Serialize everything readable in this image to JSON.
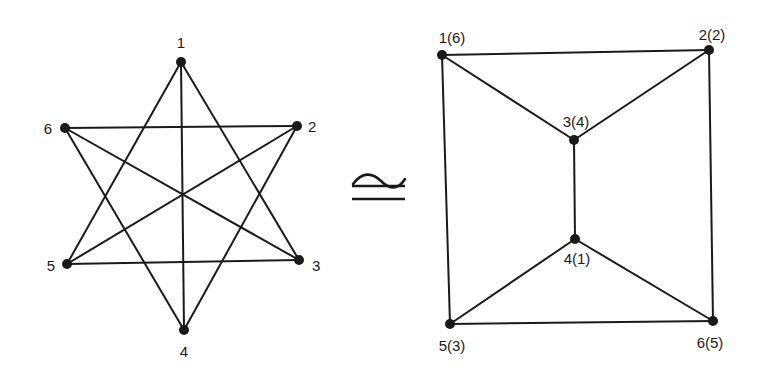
{
  "left_graph": {
    "nodes": [
      {
        "id": "1",
        "label": "1",
        "x": 181,
        "y": 62,
        "lx": 181,
        "ly": 48,
        "anchor": "middle"
      },
      {
        "id": "2",
        "label": "2",
        "x": 297,
        "y": 126,
        "lx": 308,
        "ly": 132,
        "anchor": "start"
      },
      {
        "id": "3",
        "label": "3",
        "x": 299,
        "y": 260,
        "lx": 312,
        "ly": 271,
        "anchor": "start"
      },
      {
        "id": "4",
        "label": "4",
        "x": 184,
        "y": 330,
        "lx": 184,
        "ly": 357,
        "anchor": "middle"
      },
      {
        "id": "5",
        "label": "5",
        "x": 67,
        "y": 264,
        "lx": 55,
        "ly": 271,
        "anchor": "end"
      },
      {
        "id": "6",
        "label": "6",
        "x": 65,
        "y": 128,
        "lx": 52,
        "ly": 134,
        "anchor": "end"
      }
    ],
    "edges": [
      [
        "1",
        "5"
      ],
      [
        "1",
        "4"
      ],
      [
        "1",
        "3"
      ],
      [
        "6",
        "2"
      ],
      [
        "6",
        "3"
      ],
      [
        "6",
        "4"
      ],
      [
        "2",
        "5"
      ],
      [
        "2",
        "4"
      ],
      [
        "5",
        "3"
      ]
    ]
  },
  "relation_symbol": "≅",
  "right_graph": {
    "nodes": [
      {
        "id": "1",
        "label": "1(6)",
        "x": 442,
        "y": 55,
        "lx": 452,
        "ly": 43,
        "anchor": "middle"
      },
      {
        "id": "2",
        "label": "2(2)",
        "x": 709,
        "y": 50,
        "lx": 712,
        "ly": 40,
        "anchor": "middle"
      },
      {
        "id": "3",
        "label": "3(4)",
        "x": 574,
        "y": 140,
        "lx": 576,
        "ly": 127,
        "anchor": "middle"
      },
      {
        "id": "4",
        "label": "4(1)",
        "x": 575,
        "y": 239,
        "lx": 577,
        "ly": 264,
        "anchor": "middle"
      },
      {
        "id": "5",
        "label": "5(3)",
        "x": 450,
        "y": 324,
        "lx": 452,
        "ly": 351,
        "anchor": "middle"
      },
      {
        "id": "6",
        "label": "6(5)",
        "x": 713,
        "y": 321,
        "lx": 710,
        "ly": 348,
        "anchor": "middle"
      }
    ],
    "edges": [
      [
        "1",
        "2"
      ],
      [
        "1",
        "3"
      ],
      [
        "2",
        "3"
      ],
      [
        "3",
        "4"
      ],
      [
        "1",
        "5"
      ],
      [
        "2",
        "6"
      ],
      [
        "4",
        "5"
      ],
      [
        "4",
        "6"
      ],
      [
        "5",
        "6"
      ]
    ]
  },
  "style": {
    "stroke": "#1a1a1a",
    "node_fill": "#1a1a1a"
  }
}
